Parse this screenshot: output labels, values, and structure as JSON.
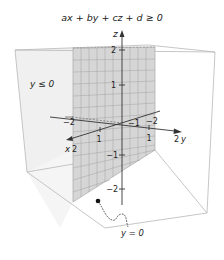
{
  "title": "ax + by + cz + d ≥ 0",
  "region_label": "y ≤ 0",
  "plane_label": "y = 0",
  "axes": {
    "x": {
      "name": "x",
      "end_label": "2",
      "ticks": [
        "1",
        "2"
      ]
    },
    "y": {
      "name": "y",
      "end_label": "2",
      "ticks": [
        "1",
        "2"
      ]
    },
    "z": {
      "name": "z",
      "ticks": [
        "2",
        "1",
        "−1",
        "−2"
      ]
    },
    "neg_x_tick": "−2",
    "neg_y_tick": "−1",
    "pos_y_tick": "−2"
  },
  "colors": {
    "plane_fill": "#d9d9d9",
    "plane_grid": "#9a9a9a",
    "halfspace_fill": "#f2f2f2",
    "box_edge": "#b5b5b5",
    "axis": "#333333"
  }
}
